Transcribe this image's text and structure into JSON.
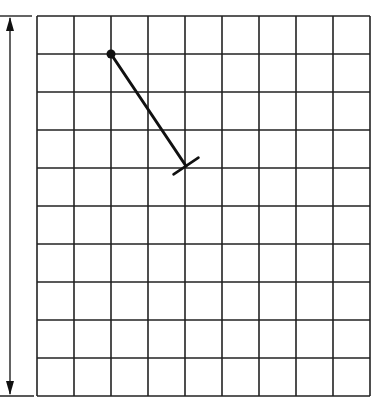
{
  "figure": {
    "type": "grid-diagram",
    "grid": {
      "columns": 9,
      "rows": 10,
      "left": 37,
      "top": 16,
      "cell_width": 37,
      "cell_height": 38,
      "line_color": "#222222"
    },
    "height_arrow": {
      "x": 10,
      "top": 16,
      "bottom": 396,
      "direction": "double-headed",
      "label": ""
    },
    "segment": {
      "start_grid": [
        2,
        1
      ],
      "end_grid": [
        4,
        4
      ],
      "start_marker": "dot",
      "end_marker": "perpendicular-tick",
      "color": "#111111"
    }
  }
}
